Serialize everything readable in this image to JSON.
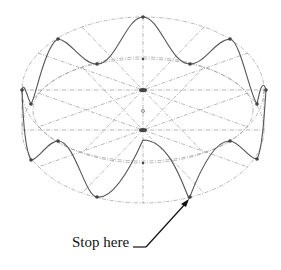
{
  "diagram": {
    "type": "cylinder-wave-construction",
    "annotation": "Stop here",
    "colors": {
      "construction": "#9a9a9a",
      "curve": "#555555",
      "points": "#444444",
      "arrow": "#111111"
    },
    "top_ellipse": {
      "cx": 143,
      "cy": 90,
      "rx": 121,
      "ry": 73
    },
    "bottom_ellipse": {
      "cx": 143,
      "cy": 130,
      "rx": 121,
      "ry": 73
    },
    "radial_divisions": 12
  }
}
